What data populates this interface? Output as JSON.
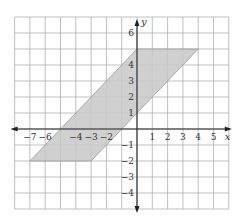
{
  "chart_data": {
    "type": "area",
    "title": "",
    "xlabel": "x",
    "ylabel": "y",
    "xlim": [
      -8,
      6
    ],
    "ylim": [
      -5,
      7
    ],
    "grid": true,
    "x_tick_labels": [
      "−7",
      "−6",
      "−4",
      "−3",
      "−2",
      "1",
      "2",
      "3",
      "4",
      "5"
    ],
    "x_ticks": [
      -7,
      -6,
      -4,
      -3,
      -2,
      1,
      2,
      3,
      4,
      5
    ],
    "y_tick_labels": [
      "6",
      "4",
      "3",
      "2",
      "1",
      "−1",
      "−2",
      "−3",
      "−4"
    ],
    "y_ticks": [
      6,
      4,
      3,
      2,
      1,
      -1,
      -2,
      -3,
      -4
    ],
    "shapes": [
      {
        "name": "parallelogram",
        "vertices": [
          [
            0,
            5
          ],
          [
            4,
            5
          ],
          [
            -3,
            -2
          ],
          [
            -7,
            -2
          ]
        ],
        "fill": "#c8c8c8",
        "stroke": "#9a9a9a"
      }
    ]
  },
  "colors": {
    "grid": "#b0b0b0",
    "axis": "#222222",
    "fill": "#c8c8c8",
    "background": "#ffffff"
  }
}
